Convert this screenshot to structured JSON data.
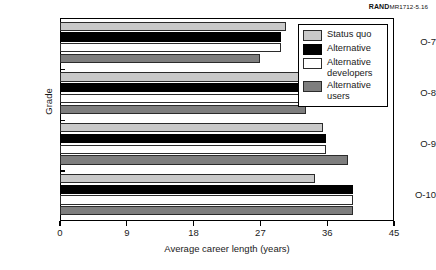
{
  "credit": {
    "brand": "RAND",
    "doc_id": "MR1712-5.16"
  },
  "chart_data": {
    "type": "bar",
    "orientation": "horizontal",
    "title": "",
    "xlabel": "Average career length (years)",
    "ylabel": "Grade",
    "categories": [
      "O-7",
      "O-8",
      "O-9",
      "O-10"
    ],
    "xlim": [
      0,
      45
    ],
    "xticks": [
      0,
      9,
      18,
      27,
      36,
      45
    ],
    "grid": false,
    "legend_position": "top-right",
    "series": [
      {
        "name": "Status quo",
        "color": "#c9c9c9",
        "values": [
          30.5,
          33.2,
          35.5,
          34.3
        ]
      },
      {
        "name": "Alternative",
        "color": "#000000",
        "values": [
          29.8,
          32.8,
          35.8,
          39.5
        ]
      },
      {
        "name": "Alternative developers",
        "color": "#ffffff",
        "values": [
          29.8,
          32.7,
          35.8,
          39.5
        ]
      },
      {
        "name": "Alternative users",
        "color": "#7e7e7e",
        "values": [
          27.0,
          33.2,
          38.8,
          39.5
        ]
      }
    ]
  },
  "legend": {
    "items": [
      {
        "label": "Status quo"
      },
      {
        "label": "Alternative"
      },
      {
        "label": "Alternative developers"
      },
      {
        "label": "Alternative users"
      }
    ]
  }
}
